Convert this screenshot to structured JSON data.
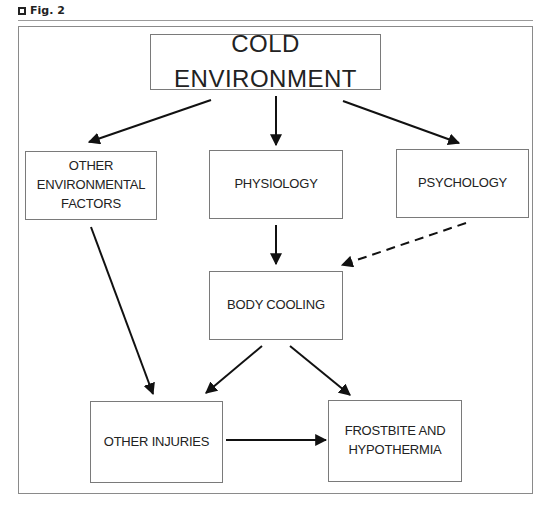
{
  "figure": {
    "label": "Fig. 2"
  },
  "nodes": {
    "cold_environment": "COLD ENVIRONMENT",
    "other_environmental_factors": "OTHER ENVIRONMENTAL FACTORS",
    "physiology": "PHYSIOLOGY",
    "psychology": "PSYCHOLOGY",
    "body_cooling": "BODY COOLING",
    "other_injuries": "OTHER INJURIES",
    "frostbite_hypothermia": "FROSTBITE AND HYPOTHERMIA"
  },
  "edges": [
    {
      "from": "COLD ENVIRONMENT",
      "to": "OTHER ENVIRONMENTAL FACTORS",
      "style": "solid"
    },
    {
      "from": "COLD ENVIRONMENT",
      "to": "PHYSIOLOGY",
      "style": "solid"
    },
    {
      "from": "COLD ENVIRONMENT",
      "to": "PSYCHOLOGY",
      "style": "solid"
    },
    {
      "from": "PHYSIOLOGY",
      "to": "BODY COOLING",
      "style": "solid"
    },
    {
      "from": "PSYCHOLOGY",
      "to": "BODY COOLING",
      "style": "dashed"
    },
    {
      "from": "OTHER ENVIRONMENTAL FACTORS",
      "to": "OTHER INJURIES",
      "style": "solid"
    },
    {
      "from": "BODY COOLING",
      "to": "OTHER INJURIES",
      "style": "solid"
    },
    {
      "from": "BODY COOLING",
      "to": "FROSTBITE AND HYPOTHERMIA",
      "style": "solid"
    },
    {
      "from": "OTHER INJURIES",
      "to": "FROSTBITE AND HYPOTHERMIA",
      "style": "solid"
    }
  ],
  "colors": {
    "line": "#111111",
    "box_border": "#7a7a7a",
    "text": "#222222"
  }
}
